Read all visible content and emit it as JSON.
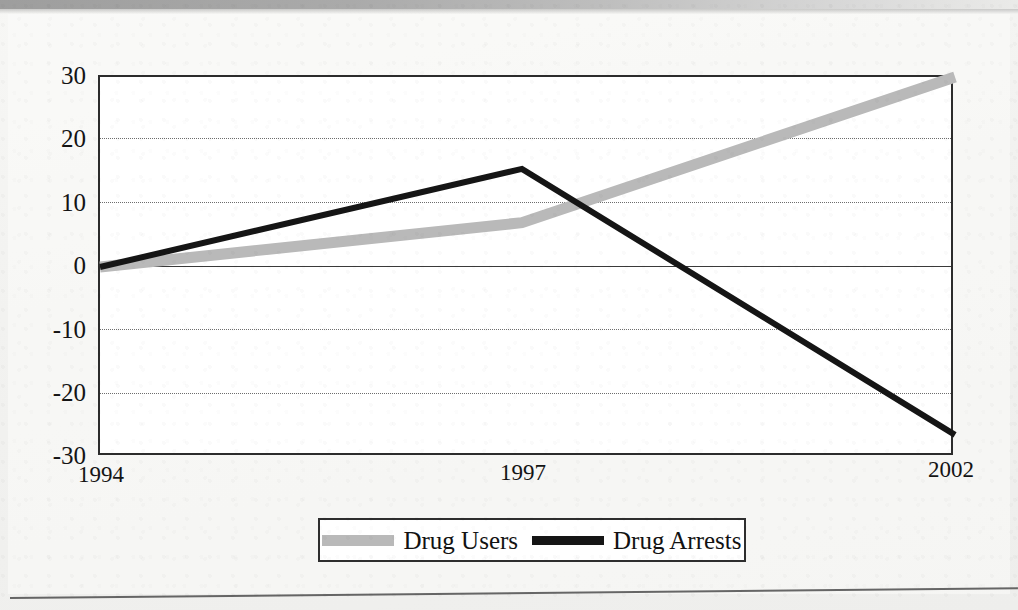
{
  "chart_data": {
    "type": "line",
    "title": "",
    "xlabel": "",
    "ylabel": "",
    "x": [
      "1994",
      "1997",
      "2002"
    ],
    "xticklabels": [
      "1994",
      "1997",
      "2002"
    ],
    "yticklabels": [
      "30",
      "20",
      "10",
      "0",
      "-10",
      "-20",
      "-30"
    ],
    "yticks": [
      30,
      20,
      10,
      0,
      -10,
      -20,
      -30
    ],
    "ylim": [
      -30,
      30
    ],
    "grid": "horizontal-dotted",
    "legend_position": "bottom-center",
    "series": [
      {
        "name": "Drug Users",
        "color": "#b9b9b9",
        "linewidth": 11,
        "values": [
          0,
          7,
          30
        ]
      },
      {
        "name": "Drug Arrests",
        "color": "#151515",
        "linewidth": 6,
        "values": [
          0,
          15.5,
          -26.5
        ]
      }
    ]
  },
  "axis": {
    "y_labels": [
      "30",
      "20",
      "10",
      "0",
      "-10",
      "-20",
      "-30"
    ],
    "x_labels": [
      "1994",
      "1997",
      "2002"
    ]
  },
  "legend": {
    "items": [
      {
        "label": "Drug Users",
        "swatch": "gray-thick-line-swatch"
      },
      {
        "label": "Drug Arrests",
        "swatch": "black-line-swatch"
      }
    ]
  }
}
